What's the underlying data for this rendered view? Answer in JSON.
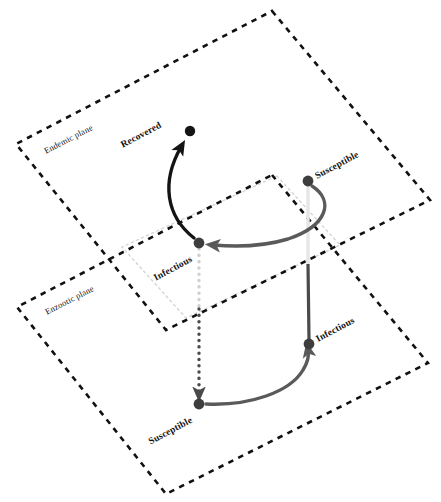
{
  "figure": {
    "type": "diagram",
    "title": "",
    "background_color": "#ffffff",
    "width": 441,
    "height": 502
  },
  "planes": [
    {
      "id": "endemic",
      "label": "Endemic plane",
      "label_x": 45,
      "label_y": 152,
      "label_rotation": -27,
      "style": "dashed",
      "color": "#111111",
      "corners": "272,11 430,200 166,330 16,144"
    },
    {
      "id": "enzootic",
      "label": "Enzootic plane",
      "label_x": 46,
      "label_y": 313,
      "label_rotation": -27,
      "style": "dashed",
      "color": "#111111",
      "corners": "272,175 428,363 166,494 17,307"
    },
    {
      "id": "intersection",
      "label": "",
      "style": "dotted",
      "color": "#d5d5d5",
      "corners": "277,176 340,245 186,318 122,247"
    }
  ],
  "nodes": [
    {
      "id": "recovered-endemic",
      "label": "Recovered",
      "plane": "endemic",
      "x": 190,
      "y": 131,
      "radius": 5.2,
      "color": "#141414",
      "label_x": 161,
      "label_y": 125,
      "label_rotation": -28,
      "label_anchor": "end"
    },
    {
      "id": "infectious-endemic",
      "label": "Infectious",
      "plane": "endemic",
      "x": 199,
      "y": 243,
      "radius": 5.4,
      "color": "#3d3d3d",
      "label_x": 192,
      "label_y": 257,
      "label_rotation": -28,
      "label_anchor": "end"
    },
    {
      "id": "susceptible-endemic",
      "label": "Susceptible",
      "plane": "endemic",
      "x": 308,
      "y": 181,
      "radius": 5.4,
      "color": "#3d3d3d",
      "label_x": 317,
      "label_y": 177,
      "label_rotation": -28,
      "label_anchor": "start"
    },
    {
      "id": "infectious-enzootic",
      "label": "Infectious",
      "plane": "enzootic",
      "x": 309,
      "y": 344,
      "radius": 5.4,
      "color": "#3d3d3d",
      "label_x": 318,
      "label_y": 340,
      "label_rotation": -28,
      "label_anchor": "start"
    },
    {
      "id": "susceptible-enzootic",
      "label": "Susceptible",
      "plane": "enzootic",
      "x": 199,
      "y": 404,
      "radius": 5.4,
      "color": "#3d3d3d",
      "label_x": 192,
      "label_y": 418,
      "label_rotation": -28,
      "label_anchor": "end"
    }
  ],
  "edges": [
    {
      "id": "infectious-to-recovered",
      "from": "infectious-endemic",
      "to": "recovered-endemic",
      "style": "solid",
      "color": "#141414",
      "width": 3.2,
      "arrow": true,
      "path": "M 194 238 C 166 216 161 182 181 147"
    },
    {
      "id": "susceptible-to-infectious-endemic",
      "from": "susceptible-endemic",
      "to": "infectious-endemic",
      "style": "solid",
      "color": "#5a5a5a",
      "width": 3.2,
      "arrow": true,
      "path": "M 312 186 C 335 201 327 226 288 239 C 265 246 236 247 213 245"
    },
    {
      "id": "susceptible-endemic-to-enzootic-vertical-upper",
      "from": "susceptible-endemic",
      "to": "infectious-enzootic",
      "style": "solid",
      "color": "#e6e6e6",
      "width": 3.2,
      "arrow": false,
      "path": "M 308 186 L 308 266"
    },
    {
      "id": "susceptible-endemic-to-enzootic-vertical-lower",
      "from": "susceptible-endemic",
      "to": "infectious-enzootic",
      "style": "solid",
      "color": "#4a4a4a",
      "width": 3.2,
      "arrow": false,
      "path": "M 308 264 L 309 340"
    },
    {
      "id": "infectious-endemic-to-susceptible-enzootic",
      "from": "infectious-endemic",
      "to": "susceptible-enzootic",
      "style": "dotted",
      "color": "#cfcfcf",
      "width": 3.2,
      "arrow": false,
      "path": "M 199 249 L 199 310"
    },
    {
      "id": "infectious-endemic-to-susceptible-enzootic-dark",
      "from": "infectious-endemic",
      "to": "susceptible-enzootic",
      "style": "dotted",
      "color": "#4a4a4a",
      "width": 3.2,
      "arrow": true,
      "path": "M 199 309 L 199 394"
    },
    {
      "id": "susceptible-to-infectious-enzootic",
      "from": "susceptible-enzootic",
      "to": "infectious-enzootic",
      "style": "solid",
      "color": "#5a5a5a",
      "width": 3.2,
      "arrow": true,
      "path": "M 206 404 C 250 406 290 392 303 370 C 308 362 309 355 308 350"
    }
  ]
}
